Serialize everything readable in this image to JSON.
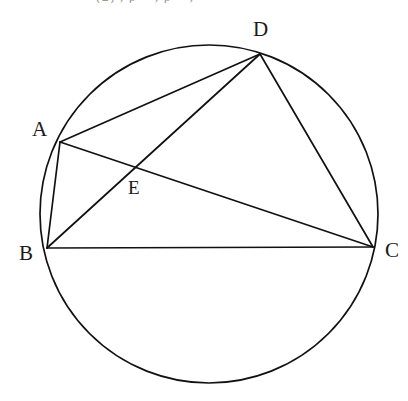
{
  "figure": {
    "caption_clipped": "(2) , p = , p = ,",
    "background_color": "#ffffff",
    "stroke_color": "#111111",
    "width": 408,
    "height": 401
  },
  "circle": {
    "name": "circumscribed-circle",
    "center_x": 209,
    "center_y": 214,
    "radius": 169
  },
  "points": [
    {
      "id": "A",
      "label": "A",
      "x": 60,
      "y": 142,
      "label_x": 32,
      "label_y": 119,
      "on_circle": true
    },
    {
      "id": "B",
      "label": "B",
      "x": 47,
      "y": 248,
      "label_x": 19,
      "label_y": 243,
      "on_circle": true
    },
    {
      "id": "C",
      "label": "C",
      "x": 373,
      "y": 247,
      "label_x": 385,
      "label_y": 240,
      "on_circle": true
    },
    {
      "id": "D",
      "label": "D",
      "x": 260,
      "y": 54,
      "label_x": 253,
      "label_y": 19,
      "on_circle": true
    },
    {
      "id": "E",
      "label": "E",
      "x": 137,
      "y": 168,
      "label_x": 128,
      "label_y": 178,
      "on_circle": false
    }
  ],
  "segments": [
    {
      "id": "AB",
      "from": "A",
      "to": "B",
      "label": "segment-ab"
    },
    {
      "id": "AD",
      "from": "A",
      "to": "D",
      "label": "segment-ad"
    },
    {
      "id": "AC",
      "from": "A",
      "to": "C",
      "label": "segment-ac-diagonal"
    },
    {
      "id": "BD",
      "from": "B",
      "to": "D",
      "label": "segment-bd-diagonal"
    },
    {
      "id": "BC",
      "from": "B",
      "to": "C",
      "label": "segment-bc"
    },
    {
      "id": "DC",
      "from": "D",
      "to": "C",
      "label": "segment-dc"
    }
  ],
  "intersection": {
    "id": "E",
    "of": [
      "AC",
      "BD"
    ],
    "x": 137,
    "y": 168
  }
}
